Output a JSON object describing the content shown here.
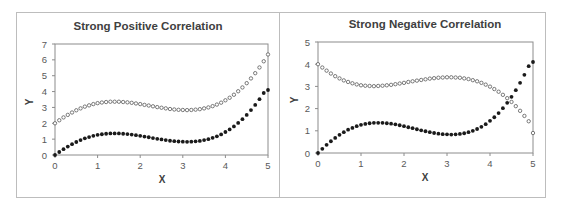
{
  "chart_data": [
    {
      "type": "scatter",
      "title": "Strong Positive Correlation",
      "xlabel": "X",
      "ylabel": "Y",
      "xlim": [
        0,
        5
      ],
      "ylim": [
        0,
        7
      ],
      "xticks": [
        "0",
        "1",
        "2",
        "3",
        "4",
        "5"
      ],
      "yticks": [
        "0",
        "1",
        "2",
        "3",
        "4",
        "5",
        "6",
        "7"
      ],
      "grid": false,
      "legend": "none",
      "series": [
        {
          "name": "open-markers",
          "marker": "open-circle",
          "x": [
            0,
            0.1,
            0.2,
            0.3,
            0.4,
            0.5,
            0.6,
            0.7,
            0.8,
            0.9,
            1.0,
            1.1,
            1.2,
            1.3,
            1.4,
            1.5,
            1.6,
            1.7,
            1.8,
            1.9,
            2.0,
            2.1,
            2.2,
            2.3,
            2.4,
            2.5,
            2.6,
            2.7,
            2.8,
            2.9,
            3.0,
            3.1,
            3.2,
            3.3,
            3.4,
            3.5,
            3.6,
            3.7,
            3.8,
            3.9,
            4.0,
            4.1,
            4.2,
            4.3,
            4.4,
            4.5,
            4.6,
            4.7,
            4.8,
            4.9,
            5.0
          ],
          "y": [
            2.0,
            2.19,
            2.37,
            2.53,
            2.68,
            2.82,
            2.94,
            3.05,
            3.13,
            3.21,
            3.27,
            3.31,
            3.34,
            3.36,
            3.36,
            3.36,
            3.34,
            3.32,
            3.29,
            3.25,
            3.21,
            3.16,
            3.12,
            3.07,
            3.02,
            2.98,
            2.94,
            2.9,
            2.87,
            2.85,
            2.84,
            2.83,
            2.84,
            2.86,
            2.89,
            2.94,
            3.0,
            3.08,
            3.18,
            3.3,
            3.45,
            3.61,
            3.8,
            4.02,
            4.26,
            4.53,
            4.83,
            5.16,
            5.52,
            5.91,
            6.34
          ]
        },
        {
          "name": "filled-markers",
          "marker": "filled-circle",
          "x": [
            0,
            0.1,
            0.2,
            0.3,
            0.4,
            0.5,
            0.6,
            0.7,
            0.8,
            0.9,
            1.0,
            1.1,
            1.2,
            1.3,
            1.4,
            1.5,
            1.6,
            1.7,
            1.8,
            1.9,
            2.0,
            2.1,
            2.2,
            2.3,
            2.4,
            2.5,
            2.6,
            2.7,
            2.8,
            2.9,
            3.0,
            3.1,
            3.2,
            3.3,
            3.4,
            3.5,
            3.6,
            3.7,
            3.8,
            3.9,
            4.0,
            4.1,
            4.2,
            4.3,
            4.4,
            4.5,
            4.6,
            4.7,
            4.8,
            4.9,
            5.0
          ],
          "y": [
            0,
            0.19,
            0.37,
            0.53,
            0.68,
            0.82,
            0.94,
            1.05,
            1.13,
            1.21,
            1.27,
            1.31,
            1.34,
            1.36,
            1.36,
            1.36,
            1.34,
            1.32,
            1.29,
            1.25,
            1.21,
            1.16,
            1.12,
            1.07,
            1.02,
            0.98,
            0.94,
            0.9,
            0.87,
            0.85,
            0.84,
            0.83,
            0.84,
            0.86,
            0.89,
            0.94,
            1.0,
            1.08,
            1.18,
            1.3,
            1.45,
            1.61,
            1.8,
            2.02,
            2.26,
            2.53,
            2.83,
            3.16,
            3.52,
            3.91,
            4.1
          ]
        }
      ]
    },
    {
      "type": "scatter",
      "title": "Strong Negative Correlation",
      "xlabel": "X",
      "ylabel": "Y",
      "xlim": [
        0,
        5
      ],
      "ylim": [
        0,
        5
      ],
      "xticks": [
        "0",
        "1",
        "2",
        "3",
        "4",
        "5"
      ],
      "yticks": [
        "0",
        "1",
        "2",
        "3",
        "4",
        "5"
      ],
      "grid": false,
      "legend": "none",
      "series": [
        {
          "name": "open-markers",
          "marker": "open-circle",
          "x": [
            0,
            0.1,
            0.2,
            0.3,
            0.4,
            0.5,
            0.6,
            0.7,
            0.8,
            0.9,
            1.0,
            1.1,
            1.2,
            1.3,
            1.4,
            1.5,
            1.6,
            1.7,
            1.8,
            1.9,
            2.0,
            2.1,
            2.2,
            2.3,
            2.4,
            2.5,
            2.6,
            2.7,
            2.8,
            2.9,
            3.0,
            3.1,
            3.2,
            3.3,
            3.4,
            3.5,
            3.6,
            3.7,
            3.8,
            3.9,
            4.0,
            4.1,
            4.2,
            4.3,
            4.4,
            4.5,
            4.6,
            4.7,
            4.8,
            4.9,
            5.0
          ],
          "y": [
            4.0,
            3.85,
            3.71,
            3.58,
            3.46,
            3.36,
            3.27,
            3.2,
            3.14,
            3.09,
            3.05,
            3.03,
            3.02,
            3.01,
            3.02,
            3.03,
            3.05,
            3.07,
            3.1,
            3.13,
            3.16,
            3.2,
            3.23,
            3.26,
            3.29,
            3.32,
            3.35,
            3.37,
            3.39,
            3.4,
            3.41,
            3.41,
            3.4,
            3.39,
            3.36,
            3.33,
            3.28,
            3.23,
            3.16,
            3.08,
            2.99,
            2.88,
            2.76,
            2.62,
            2.47,
            2.3,
            2.11,
            1.9,
            1.67,
            1.43,
            0.9
          ]
        },
        {
          "name": "filled-markers",
          "marker": "filled-circle",
          "x": [
            0,
            0.1,
            0.2,
            0.3,
            0.4,
            0.5,
            0.6,
            0.7,
            0.8,
            0.9,
            1.0,
            1.1,
            1.2,
            1.3,
            1.4,
            1.5,
            1.6,
            1.7,
            1.8,
            1.9,
            2.0,
            2.1,
            2.2,
            2.3,
            2.4,
            2.5,
            2.6,
            2.7,
            2.8,
            2.9,
            3.0,
            3.1,
            3.2,
            3.3,
            3.4,
            3.5,
            3.6,
            3.7,
            3.8,
            3.9,
            4.0,
            4.1,
            4.2,
            4.3,
            4.4,
            4.5,
            4.6,
            4.7,
            4.8,
            4.9,
            5.0
          ],
          "y": [
            0,
            0.19,
            0.37,
            0.53,
            0.68,
            0.82,
            0.94,
            1.05,
            1.13,
            1.21,
            1.27,
            1.31,
            1.34,
            1.36,
            1.36,
            1.36,
            1.34,
            1.32,
            1.29,
            1.25,
            1.21,
            1.16,
            1.12,
            1.07,
            1.02,
            0.98,
            0.94,
            0.9,
            0.87,
            0.85,
            0.84,
            0.83,
            0.84,
            0.86,
            0.89,
            0.94,
            1.0,
            1.08,
            1.18,
            1.3,
            1.45,
            1.61,
            1.8,
            2.02,
            2.26,
            2.53,
            2.83,
            3.16,
            3.52,
            3.91,
            4.1
          ]
        }
      ]
    }
  ],
  "layout": {
    "charts": [
      {
        "plot": {
          "left": 55,
          "top": 44,
          "right": 268,
          "bottom": 155
        },
        "title_x": 148,
        "title_y": 30,
        "xlabel_x": 162,
        "xlabel_y": 183,
        "ylabel_x": 33,
        "ylabel_y": 102
      },
      {
        "plot": {
          "left": 318,
          "top": 42,
          "right": 533,
          "bottom": 153
        },
        "title_x": 425,
        "title_y": 28,
        "xlabel_x": 425,
        "xlabel_y": 181,
        "ylabel_x": 298,
        "ylabel_y": 100
      }
    ],
    "colors": {
      "axis": "#8c8c8c",
      "marker_fill": "#1a1a1a",
      "marker_open_stroke": "#595959"
    }
  }
}
